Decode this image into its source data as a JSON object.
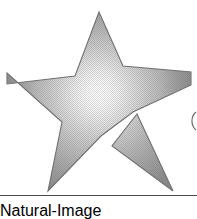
{
  "image": {
    "title": "Gradient Five-Pointed Star",
    "subject": "star",
    "style": "halftone-dithered clip art",
    "width": 197,
    "height": 202,
    "background_color": "#ffffff"
  },
  "star": {
    "name": "five-pointed-star",
    "points": 5,
    "fill_type": "radial-gradient",
    "highlight_center": {
      "x": 98,
      "y": 95
    },
    "highlight_color": "#ffffff",
    "midtone_color": "#b8b8b8",
    "edge_color": "#8a8a8a",
    "outline_color": "#707070",
    "cropped_edges": [
      "left",
      "right"
    ],
    "outline_path": "M 99,12 L 123,66 L 190,72 L 190,84 L 137,112 L 158,178 L 117,147 L 101,135 L 74,155 L 48,190 L 62,124 L 8,74 L 8,82 L 75,76 Z",
    "vertices": [
      {
        "name": "top-point-tip",
        "x": 99,
        "y": 12
      },
      {
        "name": "upper-right-inner",
        "x": 123,
        "y": 66
      },
      {
        "name": "right-arm-tip-cropped",
        "x": 190,
        "y": 78
      },
      {
        "name": "lower-right-inner",
        "x": 133,
        "y": 112
      },
      {
        "name": "lower-right-leg-tip",
        "x": 172,
        "y": 190
      },
      {
        "name": "bottom-inner",
        "x": 101,
        "y": 136
      },
      {
        "name": "lower-left-leg-tip",
        "x": 48,
        "y": 190
      },
      {
        "name": "lower-left-inner",
        "x": 62,
        "y": 122
      },
      {
        "name": "left-arm-tip-cropped",
        "x": 8,
        "y": 77
      },
      {
        "name": "upper-left-inner",
        "x": 75,
        "y": 76
      }
    ]
  },
  "notch": {
    "name": "white-separation-gap",
    "description": "white gap splitting the lower-right leg from the star body",
    "color": "#ffffff"
  },
  "rules": {
    "bottom_rule": {
      "name": "bottom-horizontal-rule",
      "y": 195,
      "x_start": 0,
      "x_end": 197,
      "color": "#4a4a4a",
      "thickness": 1
    }
  },
  "arc_mark": {
    "name": "right-edge-arc-fragment",
    "x": 190,
    "y": 120,
    "color": "#6e6e6e",
    "description": "faint partial arc clipped at the right edge"
  }
}
